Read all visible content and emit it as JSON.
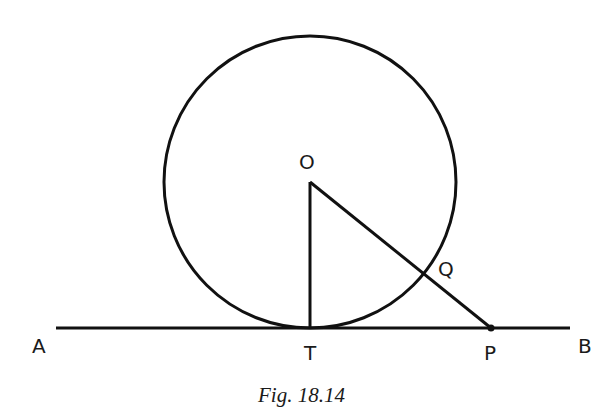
{
  "figure": {
    "caption": "Fig. 18.14",
    "stroke_color": "#111111",
    "background": "#ffffff"
  },
  "geometry": {
    "circle": {
      "center": "O",
      "cx": 310,
      "cy": 182,
      "r": 146
    },
    "points": [
      {
        "id": "O",
        "label": "O",
        "x": 310,
        "y": 182,
        "label_x": 299,
        "label_y": 169
      },
      {
        "id": "T",
        "label": "T",
        "x": 310,
        "y": 328,
        "label_x": 304,
        "label_y": 360
      },
      {
        "id": "Q",
        "label": "Q",
        "x": 425,
        "y": 272,
        "label_x": 438,
        "label_y": 275
      },
      {
        "id": "P",
        "label": "P",
        "x": 491,
        "y": 328,
        "label_x": 484,
        "label_y": 360
      },
      {
        "id": "A",
        "label": "A",
        "x": 56,
        "y": 328,
        "label_x": 32,
        "label_y": 353
      },
      {
        "id": "B",
        "label": "B",
        "x": 570,
        "y": 328,
        "label_x": 578,
        "label_y": 353
      }
    ],
    "segments": [
      {
        "name": "tangent-line-AB",
        "from": "A",
        "to": "B"
      },
      {
        "name": "radius-OT",
        "from": "O",
        "to": "T"
      },
      {
        "name": "line-OP",
        "from": "O",
        "to": "P"
      }
    ]
  },
  "labels": {
    "O": "O",
    "T": "T",
    "Q": "Q",
    "P": "P",
    "A": "A",
    "B": "B"
  }
}
